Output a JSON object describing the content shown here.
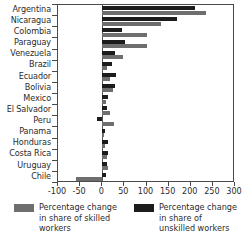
{
  "chart_data": {
    "type": "bar",
    "orientation": "horizontal",
    "title": "",
    "xlabel": "",
    "ylabel": "",
    "xlim": [
      -100,
      300
    ],
    "grid": false,
    "legend_position": "bottom",
    "categories": [
      "Argentina",
      "Nicaragua",
      "Colombia",
      "Paraguay",
      "Venezuela",
      "Brazil",
      "Ecuador",
      "Bolivia",
      "Mexico",
      "El Salvador",
      "Peru",
      "Panama",
      "Honduras",
      "Costa Rica",
      "Uruguay",
      "Chile"
    ],
    "xticks": [
      -100,
      -50,
      0,
      50,
      100,
      150,
      200,
      250,
      300
    ],
    "xticklabels": [
      "-100",
      "-50",
      "0",
      "50",
      "100",
      "150",
      "200",
      "250",
      "300"
    ],
    "series": [
      {
        "name": "Percentage change in share of unskilled workers",
        "color": "#1c1c1c",
        "values": [
          210,
          170,
          45,
          52,
          28,
          22,
          30,
          29,
          14,
          10,
          -11,
          6,
          13,
          14,
          11,
          9
        ]
      },
      {
        "name": "Percentage change in share of skilled workers",
        "color": "#6e6e6e",
        "values": [
          235,
          133,
          100,
          100,
          46,
          11,
          18,
          24,
          8,
          18,
          27,
          4,
          7,
          10,
          13,
          -60
        ]
      }
    ]
  },
  "legend": {
    "entries": [
      {
        "swatch": "skilled",
        "label": "Percentage change in share of skilled workers"
      },
      {
        "swatch": "unskilled",
        "label": "Percentage change in share of unskilled workers"
      }
    ]
  }
}
